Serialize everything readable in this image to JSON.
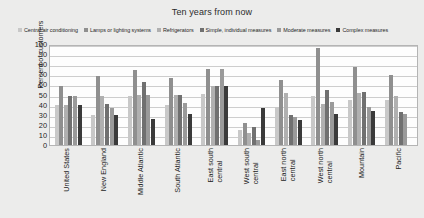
{
  "chart_data": {
    "type": "bar",
    "title": "Ten years from now",
    "xlabel": "",
    "ylabel": "Percent of customers",
    "ylim": [
      0,
      100
    ],
    "ytick_step": 10,
    "yticks": [
      100,
      90,
      80,
      70,
      60,
      50,
      40,
      30,
      20,
      10,
      0
    ],
    "grid": true,
    "legend_position": "top",
    "categories": [
      "United States",
      "New England",
      "Middle Atlantic",
      "South Atlantic",
      "East south\ncentral",
      "West south\ncentral",
      "East north\ncentral",
      "West north\ncentral",
      "Mountain",
      "Pacific"
    ],
    "series": [
      {
        "name": "Central air conditioning",
        "color": "#c8c8c8",
        "values": [
          40,
          30,
          50,
          40,
          52,
          15,
          38,
          50,
          45,
          45
        ]
      },
      {
        "name": "Lamps or lighting systems",
        "color": "#8f8f8f",
        "values": [
          60,
          70,
          76,
          68,
          77,
          22,
          66,
          98,
          79,
          71
        ]
      },
      {
        "name": "Refrigerators",
        "color": "#b0b0b0",
        "values": [
          40,
          50,
          51,
          51,
          60,
          12,
          53,
          41,
          53,
          50
        ]
      },
      {
        "name": "Simple, individual measures",
        "color": "#707070",
        "values": [
          50,
          41,
          64,
          51,
          60,
          18,
          30,
          56,
          54,
          33
        ]
      },
      {
        "name": "Moderate measures",
        "color": "#9a9a9a",
        "values": [
          50,
          37,
          51,
          42,
          77,
          5,
          28,
          43,
          38,
          31
        ]
      },
      {
        "name": "Complex measures",
        "color": "#3a3a3a",
        "values": [
          40,
          30,
          26,
          31,
          60,
          37,
          25,
          31,
          34,
          0
        ]
      }
    ]
  }
}
